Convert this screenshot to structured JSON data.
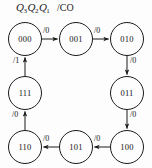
{
  "figure": {
    "type": "state-transition-diagram",
    "header": {
      "state_vars": "Q3Q2Q1",
      "state_var_base": "Q",
      "state_var_subs": [
        "3",
        "2",
        "1"
      ],
      "output_label": "/CO"
    },
    "nodes": [
      {
        "id": "s000",
        "label": "000",
        "x": 8,
        "y": 22
      },
      {
        "id": "s001",
        "label": "001",
        "x": 59,
        "y": 22
      },
      {
        "id": "s010",
        "label": "010",
        "x": 110,
        "y": 22
      },
      {
        "id": "s011",
        "label": "011",
        "x": 110,
        "y": 76
      },
      {
        "id": "s100",
        "label": "100",
        "x": 110,
        "y": 130
      },
      {
        "id": "s101",
        "label": "101",
        "x": 59,
        "y": 130
      },
      {
        "id": "s110",
        "label": "110",
        "x": 8,
        "y": 130
      },
      {
        "id": "s111",
        "label": "111",
        "x": 8,
        "y": 76
      }
    ],
    "edges": [
      {
        "from": "000",
        "to": "001",
        "label": "/0",
        "lx": 43,
        "ly": 26
      },
      {
        "from": "001",
        "to": "010",
        "label": "/0",
        "lx": 94,
        "ly": 26
      },
      {
        "from": "010",
        "to": "011",
        "label": "/0",
        "lx": 130,
        "ly": 56
      },
      {
        "from": "011",
        "to": "100",
        "label": "/0",
        "lx": 130,
        "ly": 110
      },
      {
        "from": "100",
        "to": "101",
        "label": "/0",
        "lx": 94,
        "ly": 134
      },
      {
        "from": "101",
        "to": "110",
        "label": "/0",
        "lx": 43,
        "ly": 134
      },
      {
        "from": "110",
        "to": "111",
        "label": "/0",
        "lx": 12,
        "ly": 110
      },
      {
        "from": "111",
        "to": "000",
        "label": "/1",
        "lx": 13,
        "ly": 56
      }
    ],
    "colors": {
      "stroke": "#1b1b1b",
      "text": "#141414",
      "background": "#fdfdfd"
    },
    "geometry": {
      "radius": 16.5,
      "stroke_width": 1
    }
  }
}
